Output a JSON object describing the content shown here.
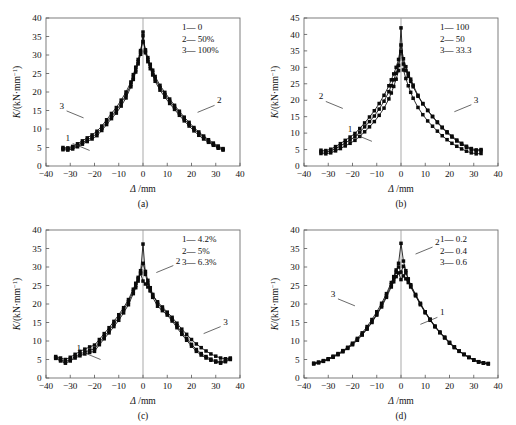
{
  "figure": {
    "axis_x_label": "Δ",
    "axis_x_unit": "/mm",
    "axis_y_label": "K",
    "axis_y_unit": "/(kN·mm",
    "axis_y_unit_sup": "−1",
    "axis_y_unit_close": ")",
    "legend_dash": "—"
  },
  "chart_data": [
    {
      "type": "line",
      "panel": "a",
      "caption": "(a)",
      "title": "",
      "xlabel": "Δ/mm",
      "ylabel": "K/(kN·mm⁻¹)",
      "xlim": [
        -40,
        40
      ],
      "ylim": [
        0,
        40
      ],
      "xticks": [
        -40,
        -30,
        -20,
        -10,
        0,
        10,
        20,
        30,
        40
      ],
      "yticks": [
        0,
        5,
        10,
        15,
        20,
        25,
        30,
        35,
        40
      ],
      "grid": false,
      "legend_position": "top-right",
      "legend": [
        {
          "key": "1",
          "label": "0"
        },
        {
          "key": "2",
          "label": "50%"
        },
        {
          "key": "3",
          "label": "100%"
        }
      ],
      "callouts": [
        {
          "key": "3",
          "x": -24.5,
          "y": 13.0
        },
        {
          "key": "1",
          "x": -22.0,
          "y": 4.2
        },
        {
          "key": "2",
          "x": 22.5,
          "y": 14.5
        }
      ],
      "x": [
        -33,
        -31,
        -29,
        -27,
        -25,
        -23,
        -21,
        -19,
        -17,
        -15,
        -13,
        -11,
        -9,
        -7,
        -5,
        -4,
        -3,
        -2,
        -1,
        0,
        1,
        2,
        3,
        4,
        5,
        7,
        9,
        11,
        13,
        15,
        17,
        19,
        21,
        23,
        25,
        27,
        29,
        31,
        33
      ],
      "series": [
        {
          "name": "1",
          "values": [
            4.4,
            4.3,
            4.6,
            5.2,
            5.9,
            6.6,
            7.3,
            8.2,
            9.6,
            11.2,
            12.8,
            14.3,
            16.2,
            18.4,
            21.4,
            23.4,
            25.4,
            27.6,
            30.2,
            36.2,
            30.6,
            28.2,
            26.3,
            24.6,
            22.9,
            20.5,
            18.6,
            16.9,
            15.3,
            13.7,
            12.2,
            10.8,
            9.5,
            8.3,
            7.3,
            6.4,
            5.6,
            4.8,
            4.3
          ]
        },
        {
          "name": "2",
          "values": [
            4.7,
            4.6,
            5.0,
            5.6,
            6.3,
            7.0,
            7.8,
            8.8,
            10.2,
            11.8,
            13.4,
            15.0,
            17.0,
            19.2,
            22.0,
            24.0,
            26.0,
            28.2,
            30.8,
            35.2,
            31.0,
            28.8,
            27.0,
            25.3,
            23.6,
            21.2,
            19.3,
            17.5,
            15.9,
            14.3,
            12.7,
            11.3,
            10.0,
            8.8,
            7.7,
            6.7,
            5.9,
            5.1,
            4.5
          ]
        },
        {
          "name": "3",
          "values": [
            5.0,
            4.9,
            5.3,
            6.0,
            6.8,
            7.6,
            8.4,
            9.4,
            10.8,
            12.5,
            14.2,
            15.8,
            17.8,
            20.0,
            22.7,
            24.7,
            26.7,
            28.8,
            31.2,
            33.6,
            31.4,
            29.3,
            27.5,
            25.9,
            24.2,
            21.8,
            19.9,
            18.1,
            16.4,
            14.8,
            13.2,
            11.8,
            10.4,
            9.2,
            8.1,
            7.1,
            6.2,
            5.4,
            4.7
          ]
        }
      ]
    },
    {
      "type": "line",
      "panel": "b",
      "caption": "(b)",
      "title": "",
      "xlabel": "Δ/mm",
      "ylabel": "K/(kN·mm⁻¹)",
      "xlim": [
        -40,
        40
      ],
      "ylim": [
        0,
        45
      ],
      "xticks": [
        -40,
        -30,
        -20,
        -10,
        0,
        10,
        20,
        30,
        40
      ],
      "yticks": [
        0,
        5,
        10,
        15,
        20,
        25,
        30,
        35,
        40,
        45
      ],
      "grid": false,
      "legend_position": "top-right",
      "legend": [
        {
          "key": "1",
          "label": "100"
        },
        {
          "key": "2",
          "label": "50"
        },
        {
          "key": "3",
          "label": "33.3"
        }
      ],
      "callouts": [
        {
          "key": "2",
          "x": -24.0,
          "y": 17.5
        },
        {
          "key": "1",
          "x": -12.0,
          "y": 7.5
        },
        {
          "key": "3",
          "x": 22.0,
          "y": 16.5
        }
      ],
      "x": [
        -33,
        -31,
        -29,
        -27,
        -25,
        -23,
        -21,
        -19,
        -17,
        -15,
        -13,
        -11,
        -9,
        -7,
        -5,
        -4,
        -3,
        -2,
        -1,
        0,
        1,
        2,
        3,
        4,
        5,
        7,
        9,
        11,
        13,
        15,
        17,
        19,
        21,
        23,
        25,
        27,
        29,
        31,
        33
      ],
      "series": [
        {
          "name": "1",
          "values": [
            3.8,
            3.7,
            4.0,
            4.6,
            5.3,
            6.1,
            6.9,
            7.8,
            9.0,
            10.4,
            11.9,
            13.5,
            15.4,
            17.6,
            20.4,
            22.2,
            24.2,
            26.4,
            29.0,
            42.0,
            29.2,
            26.6,
            24.4,
            22.4,
            20.6,
            17.8,
            15.6,
            13.7,
            12.1,
            10.6,
            9.2,
            8.0,
            6.9,
            6.0,
            5.2,
            4.5,
            4.0,
            3.7,
            3.8
          ]
        },
        {
          "name": "2",
          "values": [
            4.8,
            4.7,
            5.1,
            5.9,
            6.8,
            7.8,
            8.8,
            9.9,
            11.4,
            13.1,
            14.9,
            16.8,
            19.0,
            21.5,
            24.4,
            26.2,
            28.0,
            30.0,
            32.4,
            36.8,
            32.6,
            30.2,
            28.2,
            26.4,
            24.6,
            21.5,
            19.0,
            16.9,
            15.0,
            13.2,
            11.6,
            10.1,
            8.8,
            7.6,
            6.6,
            5.7,
            5.0,
            4.6,
            4.7
          ]
        },
        {
          "name": "3",
          "values": [
            4.3,
            4.2,
            4.6,
            5.3,
            6.1,
            7.0,
            7.9,
            8.9,
            10.3,
            11.9,
            13.5,
            15.2,
            17.3,
            19.7,
            22.6,
            24.4,
            26.2,
            28.2,
            30.6,
            34.8,
            31.0,
            29.0,
            27.3,
            25.7,
            24.1,
            21.2,
            18.9,
            16.9,
            15.1,
            13.4,
            11.8,
            10.4,
            9.1,
            7.9,
            6.9,
            6.0,
            5.3,
            4.9,
            5.0
          ]
        }
      ]
    },
    {
      "type": "line",
      "panel": "c",
      "caption": "(c)",
      "title": "",
      "xlabel": "Δ/mm",
      "ylabel": "K/(kN·mm⁻¹)",
      "xlim": [
        -40,
        40
      ],
      "ylim": [
        0,
        40
      ],
      "xticks": [
        -40,
        -30,
        -20,
        -10,
        0,
        10,
        20,
        30,
        40
      ],
      "yticks": [
        0,
        5,
        10,
        15,
        20,
        25,
        30,
        35,
        40
      ],
      "grid": false,
      "legend_position": "top-right",
      "legend": [
        {
          "key": "1",
          "label": "4.2%"
        },
        {
          "key": "2",
          "label": "5%"
        },
        {
          "key": "3",
          "label": "6.3%"
        }
      ],
      "callouts": [
        {
          "key": "2",
          "x": 5.5,
          "y": 28.5
        },
        {
          "key": "1",
          "x": -17.5,
          "y": 5.0
        },
        {
          "key": "3",
          "x": 25.0,
          "y": 12.0
        }
      ],
      "x": [
        -36,
        -34,
        -32,
        -30,
        -28,
        -26,
        -24,
        -22,
        -20,
        -18,
        -16,
        -14,
        -12,
        -10,
        -8,
        -6,
        -4,
        -3,
        -2,
        -1,
        0,
        1,
        2,
        3,
        4,
        6,
        8,
        10,
        12,
        14,
        16,
        18,
        20,
        22,
        24,
        26,
        28,
        30,
        32,
        34,
        36
      ],
      "series": [
        {
          "name": "1",
          "values": [
            5.3,
            4.6,
            4.0,
            4.6,
            5.4,
            6.0,
            6.5,
            6.9,
            7.2,
            9.0,
            10.6,
            12.2,
            13.9,
            15.6,
            17.6,
            19.8,
            22.8,
            24.4,
            26.2,
            28.4,
            36.2,
            28.0,
            25.6,
            23.6,
            21.8,
            19.4,
            18.2,
            17.0,
            15.4,
            13.6,
            11.8,
            10.2,
            8.6,
            7.2,
            6.2,
            5.4,
            4.8,
            4.3,
            4.0,
            4.4,
            5.0
          ]
        },
        {
          "name": "2",
          "values": [
            5.5,
            4.9,
            4.4,
            5.0,
            5.8,
            6.5,
            7.0,
            7.5,
            7.9,
            9.6,
            11.2,
            12.8,
            14.6,
            16.4,
            18.4,
            20.6,
            23.4,
            25.0,
            26.8,
            29.0,
            31.0,
            28.8,
            26.4,
            24.4,
            22.6,
            20.2,
            18.8,
            17.4,
            15.9,
            14.1,
            12.3,
            10.7,
            9.1,
            7.7,
            6.6,
            5.8,
            5.1,
            4.6,
            4.3,
            4.7,
            5.2
          ]
        },
        {
          "name": "3",
          "values": [
            5.8,
            5.4,
            5.0,
            5.6,
            6.4,
            7.2,
            7.8,
            8.4,
            8.9,
            10.4,
            12.0,
            13.6,
            15.3,
            17.1,
            19.0,
            21.2,
            24.0,
            25.6,
            27.2,
            28.2,
            26.2,
            25.4,
            24.6,
            23.6,
            22.4,
            20.6,
            19.2,
            17.8,
            16.4,
            14.8,
            13.2,
            11.8,
            10.4,
            9.2,
            8.2,
            7.3,
            6.5,
            5.9,
            5.4,
            5.2,
            5.4
          ]
        }
      ]
    },
    {
      "type": "line",
      "panel": "d",
      "caption": "(d)",
      "title": "",
      "xlabel": "Δ/mm",
      "ylabel": "K/(kN·mm⁻¹)",
      "xlim": [
        -40,
        40
      ],
      "ylim": [
        0,
        40
      ],
      "xticks": [
        -40,
        -30,
        -20,
        -10,
        0,
        10,
        20,
        30,
        40
      ],
      "yticks": [
        0,
        5,
        10,
        15,
        20,
        25,
        30,
        35,
        40
      ],
      "grid": false,
      "legend_position": "top-right",
      "legend": [
        {
          "key": "1",
          "label": "0.2"
        },
        {
          "key": "2",
          "label": "0.4"
        },
        {
          "key": "3",
          "label": "0.6"
        }
      ],
      "callouts": [
        {
          "key": "2",
          "x": 6.0,
          "y": 33.5
        },
        {
          "key": "3",
          "x": -19.0,
          "y": 19.5
        },
        {
          "key": "1",
          "x": 8.0,
          "y": 14.5
        }
      ],
      "x": [
        -36,
        -34,
        -32,
        -30,
        -28,
        -26,
        -24,
        -22,
        -20,
        -18,
        -16,
        -14,
        -12,
        -10,
        -8,
        -6,
        -4,
        -3,
        -2,
        -1,
        0,
        1,
        2,
        3,
        4,
        6,
        8,
        10,
        12,
        14,
        16,
        18,
        20,
        22,
        24,
        26,
        28,
        30,
        32,
        34,
        36
      ],
      "series": [
        {
          "name": "1",
          "values": [
            3.8,
            4.1,
            4.5,
            5.0,
            5.6,
            6.3,
            7.1,
            8.0,
            9.0,
            10.2,
            11.6,
            13.2,
            15.0,
            17.0,
            19.2,
            21.8,
            24.6,
            26.0,
            27.4,
            28.4,
            26.6,
            27.6,
            26.8,
            25.8,
            24.6,
            22.2,
            19.8,
            17.6,
            15.6,
            13.8,
            12.2,
            10.8,
            9.4,
            8.2,
            7.2,
            6.3,
            5.5,
            4.8,
            4.3,
            4.0,
            3.8
          ]
        },
        {
          "name": "2",
          "values": [
            3.9,
            4.2,
            4.6,
            5.1,
            5.7,
            6.4,
            7.2,
            8.1,
            9.1,
            10.4,
            11.8,
            13.4,
            15.2,
            17.3,
            19.6,
            22.2,
            25.2,
            26.8,
            28.6,
            31.0,
            36.4,
            31.6,
            29.0,
            26.8,
            25.2,
            22.6,
            20.2,
            17.9,
            15.9,
            14.0,
            12.4,
            11.0,
            9.6,
            8.4,
            7.3,
            6.4,
            5.6,
            4.9,
            4.4,
            4.1,
            3.9
          ]
        },
        {
          "name": "3",
          "values": [
            4.0,
            4.3,
            4.7,
            5.2,
            5.9,
            6.6,
            7.4,
            8.3,
            9.4,
            10.7,
            12.2,
            13.9,
            15.8,
            17.9,
            20.2,
            22.8,
            25.8,
            27.4,
            29.2,
            30.0,
            28.6,
            30.2,
            28.4,
            26.6,
            25.0,
            22.4,
            20.0,
            17.8,
            15.8,
            14.0,
            12.4,
            11.0,
            9.6,
            8.4,
            7.3,
            6.4,
            5.6,
            4.9,
            4.4,
            4.1,
            3.9
          ]
        }
      ]
    }
  ]
}
